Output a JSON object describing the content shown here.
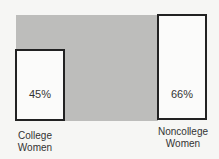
{
  "chart_data": {
    "type": "bar",
    "title": "",
    "xlabel": "",
    "ylabel": "",
    "categories": [
      "College Women",
      "Noncollege Women"
    ],
    "values": [
      45,
      66
    ],
    "value_labels": [
      "45%",
      "66%"
    ],
    "units": "%",
    "ylim": [
      0,
      66
    ],
    "grid": false,
    "annotation": "gray band connecting bar tops shows gap between groups"
  },
  "bars": [
    {
      "label_line1": "College",
      "label_line2": "Women",
      "value_label": "45%"
    },
    {
      "label_line1": "Noncollege",
      "label_line2": "Women",
      "value_label": "66%"
    }
  ],
  "colors": {
    "band": "#bdbdbb",
    "bar_fill": "#fbfbfa",
    "bar_border": "#222222",
    "background": "#f6f6f4"
  }
}
